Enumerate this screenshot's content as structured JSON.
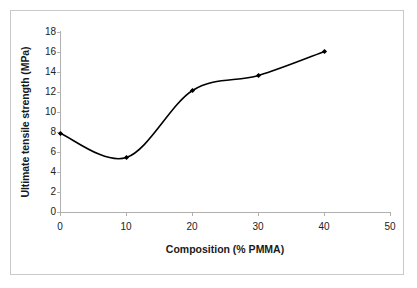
{
  "chart_data": {
    "type": "line",
    "title": "",
    "xlabel": "Composition (% PMMA)",
    "ylabel": "Ultimate tensile strength (MPa)",
    "x": [
      0,
      10,
      20,
      30,
      40
    ],
    "values": [
      7.9,
      5.5,
      12.2,
      13.7,
      16.1
    ],
    "series": [
      {
        "name": "Ultimate tensile strength",
        "values": [
          7.9,
          5.5,
          12.2,
          13.7,
          16.1
        ]
      }
    ],
    "xlim": [
      0,
      50
    ],
    "ylim": [
      0,
      18
    ],
    "xticks": [
      "0",
      "10",
      "20",
      "30",
      "40",
      "50"
    ],
    "yticks": [
      "0",
      "2",
      "4",
      "6",
      "8",
      "10",
      "12",
      "14",
      "16",
      "18"
    ],
    "grid": false,
    "legend": false,
    "marker": "diamond",
    "line_color": "#000000",
    "axis_color": "#b0b0b0",
    "smoothing": "spline"
  },
  "figure": {
    "border_color": "#c9c9c9",
    "background": "#ffffff"
  }
}
